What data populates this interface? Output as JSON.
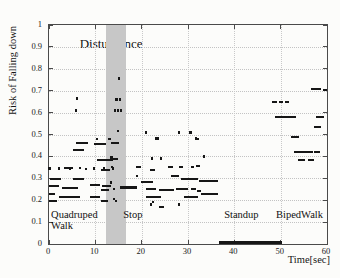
{
  "figure": {
    "background": "#fcfcfa",
    "axis_color": "#4a4a4a",
    "grid_color": "#c3c3c3",
    "point_color": "#161616",
    "band_color": "#c7c7c7"
  },
  "chart_data": {
    "type": "scatter",
    "title": "",
    "xlabel": "Time[sec]",
    "ylabel": "Risk of Falling down",
    "xlim": [
      0,
      60
    ],
    "ylim": [
      0,
      1
    ],
    "grid": true,
    "xticks": [
      0,
      10,
      20,
      30,
      40,
      50,
      60
    ],
    "xtick_labels": [
      "0",
      "10",
      "20",
      "30",
      "40",
      "50",
      "60"
    ],
    "yticks": [
      0,
      0.1,
      0.2,
      0.3,
      0.4,
      0.5,
      0.6,
      0.7,
      0.8,
      0.9,
      1
    ],
    "ytick_labels": [
      "0",
      "0.1",
      "0.2",
      "0.3",
      "0.4",
      "0.5",
      "0.6",
      "0.7",
      "0.8",
      "0.9",
      "1"
    ],
    "disturbance_band": {
      "label": "Disturbance",
      "x_start": 12.3,
      "x_end": 16.6,
      "label_x": 13.4,
      "label_y": 0.915
    },
    "phases": [
      {
        "name": "Quadruped Walk",
        "lines": [
          "Quadruped",
          "Walk"
        ],
        "x": 0.45,
        "y": 0.133
      },
      {
        "name": "Stop",
        "lines": [
          "Stop"
        ],
        "x": 16.0,
        "y": 0.133
      },
      {
        "name": "Standup",
        "lines": [
          "Standup"
        ],
        "x": 37.8,
        "y": 0.133
      },
      {
        "name": "BipedWalk",
        "lines": [
          "BipedWalk"
        ],
        "x": 49.0,
        "y": 0.133
      }
    ],
    "zero_risk_segment": {
      "x_start": 36.6,
      "x_end": 50.3,
      "y": 0
    },
    "segments": [
      [
        0.2,
        2.5,
        0.295
      ],
      [
        5.2,
        7.6,
        0.295
      ],
      [
        0.0,
        2.2,
        0.266
      ],
      [
        2.8,
        6.3,
        0.257
      ],
      [
        8.9,
        11.0,
        0.268
      ],
      [
        11.4,
        13.4,
        0.265
      ],
      [
        11.3,
        12.9,
        0.245
      ],
      [
        0.0,
        1.3,
        0.23
      ],
      [
        2.2,
        6.7,
        0.216
      ],
      [
        8.9,
        11.0,
        0.216
      ],
      [
        0.0,
        1.7,
        0.197
      ],
      [
        11.2,
        12.7,
        0.197
      ],
      [
        5.8,
        8.4,
        0.46
      ],
      [
        9.7,
        12.3,
        0.455
      ],
      [
        5.2,
        7.6,
        0.43
      ],
      [
        10.4,
        13.8,
        0.385
      ],
      [
        3.2,
        5.2,
        0.345
      ],
      [
        13.4,
        15.1,
        0.462
      ],
      [
        13.8,
        15.0,
        0.39
      ],
      [
        11.2,
        13.2,
        0.34
      ],
      [
        15.3,
        19.0,
        0.26,
        3
      ],
      [
        18.8,
        19.9,
        0.352
      ],
      [
        21.8,
        22.9,
        0.34
      ],
      [
        25.7,
        26.8,
        0.352
      ],
      [
        28.1,
        28.9,
        0.35
      ],
      [
        30.7,
        31.3,
        0.35
      ],
      [
        31.7,
        32.6,
        0.358
      ],
      [
        19.9,
        22.4,
        0.285
      ],
      [
        26.3,
        28.1,
        0.31
      ],
      [
        28.4,
        32.2,
        0.296
      ],
      [
        32.4,
        36.5,
        0.289
      ],
      [
        20.9,
        23.1,
        0.252
      ],
      [
        23.8,
        27.0,
        0.248
      ],
      [
        27.4,
        30.0,
        0.252
      ],
      [
        30.7,
        31.7,
        0.252
      ],
      [
        20.9,
        24.2,
        0.215
      ],
      [
        29.2,
        32.2,
        0.215
      ],
      [
        32.8,
        36.5,
        0.23
      ],
      [
        32.0,
        32.8,
        0.243
      ],
      [
        23.8,
        24.8,
        0.17
      ],
      [
        48.2,
        49.2,
        0.647
      ],
      [
        49.7,
        50.6,
        0.647
      ],
      [
        51.0,
        51.8,
        0.647
      ],
      [
        48.8,
        53.4,
        0.578
      ],
      [
        57.7,
        59.4,
        0.578
      ],
      [
        56.6,
        58.7,
        0.71
      ],
      [
        59.1,
        59.9,
        0.705
      ],
      [
        57.2,
        58.7,
        0.532
      ],
      [
        52.3,
        54.0,
        0.49
      ],
      [
        52.9,
        57.0,
        0.418
      ],
      [
        57.3,
        58.4,
        0.418
      ],
      [
        53.8,
        55.2,
        0.382
      ],
      [
        55.9,
        57.2,
        0.382
      ]
    ],
    "points": [
      [
        5.8,
        0.61
      ],
      [
        6.1,
        0.665
      ],
      [
        0.1,
        0.345
      ],
      [
        2.2,
        0.345
      ],
      [
        4.5,
        0.345
      ],
      [
        6.7,
        0.347
      ],
      [
        8.0,
        0.343
      ],
      [
        9.7,
        0.345
      ],
      [
        11.9,
        0.347
      ],
      [
        13.8,
        0.345
      ],
      [
        15.1,
        0.755
      ],
      [
        14.6,
        0.66
      ],
      [
        15.3,
        0.66
      ],
      [
        14.2,
        0.61
      ],
      [
        14.9,
        0.61
      ],
      [
        15.5,
        0.61
      ],
      [
        14.9,
        0.515
      ],
      [
        10.3,
        0.48
      ],
      [
        13.1,
        0.48
      ],
      [
        13.5,
        0.395
      ],
      [
        13.6,
        0.352
      ],
      [
        13.4,
        0.28
      ],
      [
        14.5,
        0.197
      ],
      [
        14.0,
        0.252
      ],
      [
        14.0,
        0.206
      ],
      [
        21.0,
        0.51
      ],
      [
        28.1,
        0.51
      ],
      [
        30.5,
        0.51
      ],
      [
        23.5,
        0.482
      ],
      [
        31.7,
        0.482
      ],
      [
        32.2,
        0.48
      ],
      [
        23.1,
        0.482
      ],
      [
        22.2,
        0.39
      ],
      [
        24.2,
        0.39
      ],
      [
        33.5,
        0.4
      ],
      [
        19.0,
        0.31
      ],
      [
        22.0,
        0.18
      ],
      [
        28.1,
        0.18
      ],
      [
        22.5,
        0.193
      ]
    ]
  }
}
